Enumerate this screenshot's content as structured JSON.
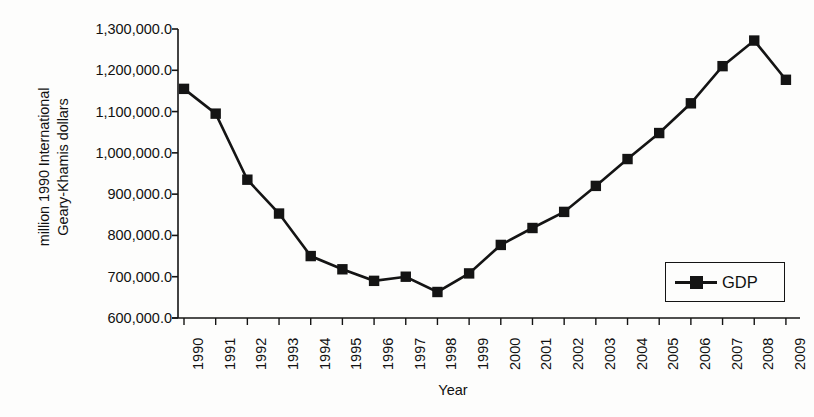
{
  "chart_data": {
    "type": "line",
    "title": "",
    "xlabel": "Year",
    "ylabel": "million 1990 International Geary-Khamis dollars",
    "ylabel_lines": [
      "million 1990 International",
      "Geary-Khamis dollars"
    ],
    "categories": [
      "1990",
      "1991",
      "1992",
      "1993",
      "1994",
      "1995",
      "1996",
      "1997",
      "1998",
      "1999",
      "2000",
      "2001",
      "2002",
      "2003",
      "2004",
      "2005",
      "2006",
      "2007",
      "2008",
      "2009"
    ],
    "x": [
      1990,
      1991,
      1992,
      1993,
      1994,
      1995,
      1996,
      1997,
      1998,
      1999,
      2000,
      2001,
      2002,
      2003,
      2004,
      2005,
      2006,
      2007,
      2008,
      2009
    ],
    "series": [
      {
        "name": "GDP",
        "marker": "square",
        "color": "#141414",
        "values": [
          1155000,
          1095000,
          935000,
          853000,
          750000,
          718000,
          690000,
          700000,
          663000,
          708000,
          777000,
          818000,
          857000,
          920000,
          985000,
          1048000,
          1120000,
          1210000,
          1272000,
          1177000
        ]
      }
    ],
    "ylim": [
      600000,
      1300000
    ],
    "ytick_values": [
      600000,
      700000,
      800000,
      900000,
      1000000,
      1100000,
      1200000,
      1300000
    ],
    "ytick_labels": [
      "600,000.0",
      "700,000.0",
      "800,000.0",
      "900,000.0",
      "1,000,000.0",
      "1,100,000.0",
      "1,200,000.0",
      "1,300,000.0"
    ],
    "grid": false,
    "legend": {
      "position": "bottom-right",
      "entries": [
        "GDP"
      ]
    }
  },
  "legend": {
    "gdp_label": "GDP"
  },
  "axes": {
    "x_title": "Year",
    "y_title_line1": "million 1990 International",
    "y_title_line2": "Geary-Khamis dollars"
  }
}
